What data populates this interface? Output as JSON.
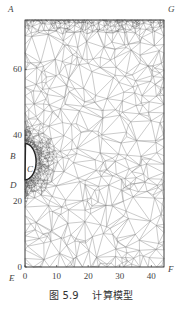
{
  "figure": {
    "caption_number": "图 5.9",
    "caption_title": "计算模型",
    "x_ticks": [
      "0",
      "10",
      "20",
      "30",
      "40"
    ],
    "x_tick_values": [
      0,
      10,
      20,
      30,
      40
    ],
    "y_ticks": [
      "0",
      "20",
      "40",
      "60"
    ],
    "y_tick_values": [
      0,
      20,
      40,
      60
    ],
    "x_range": [
      0,
      44
    ],
    "y_range": [
      0,
      75
    ],
    "point_labels": {
      "A": "A",
      "B": "B",
      "C": "C",
      "D": "D",
      "E": "E",
      "F": "F",
      "G": "G"
    },
    "cavity": {
      "center_y": 32,
      "radius": 5.5,
      "depth": 3.5
    },
    "colors": {
      "mesh": "#8a8a8a",
      "dense_mesh": "#555555",
      "border": "#333333",
      "text": "#444444"
    }
  }
}
